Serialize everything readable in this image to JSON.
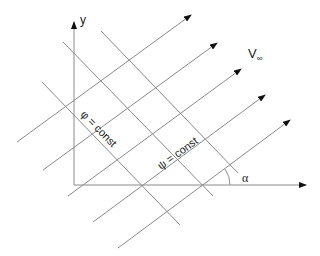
{
  "diagram": {
    "axes": {
      "y_label": "y",
      "origin": [
        74,
        185
      ],
      "y_end": [
        74,
        22
      ],
      "x_end": [
        306,
        185
      ]
    },
    "free_stream_label": "V",
    "free_stream_subscript": "∞",
    "angle_label": "α",
    "equipotential_label": "φ = const",
    "streamline_label": "ψ = const",
    "colors": {
      "line": "#8a8a8a",
      "axis": "#8a8a8a",
      "arrow": "#111111",
      "text": "#222222"
    },
    "streamlines": [
      {
        "x1": 17,
        "y1": 142,
        "x2": 191,
        "y2": 15
      },
      {
        "x1": 43,
        "y1": 170,
        "x2": 217,
        "y2": 43
      },
      {
        "x1": 68,
        "y1": 196,
        "x2": 241,
        "y2": 69
      },
      {
        "x1": 93,
        "y1": 222,
        "x2": 265,
        "y2": 95
      },
      {
        "x1": 118,
        "y1": 248,
        "x2": 290,
        "y2": 120
      }
    ],
    "equipotentials": [
      {
        "x1": 42,
        "y1": 82,
        "x2": 180,
        "y2": 225
      },
      {
        "x1": 63,
        "y1": 42,
        "x2": 213,
        "y2": 196
      },
      {
        "x1": 101,
        "y1": 31,
        "x2": 238,
        "y2": 173
      }
    ]
  }
}
